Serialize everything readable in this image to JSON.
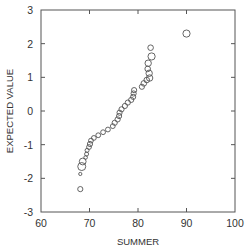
{
  "chart_data": {
    "type": "scatter",
    "title": "",
    "xlabel": "SUMMER",
    "ylabel": "EXPECTED VALUE",
    "xlim": [
      60,
      100
    ],
    "ylim": [
      -3,
      3
    ],
    "xticks": [
      60,
      70,
      80,
      90,
      100
    ],
    "yticks": [
      -3,
      -2,
      -1,
      0,
      1,
      2,
      3
    ],
    "xtick_labels": [
      "60",
      "70",
      "80",
      "90",
      "100"
    ],
    "ytick_labels": [
      "-3",
      "-2",
      "-1",
      "0",
      "1",
      "2",
      "3"
    ],
    "grid": false,
    "legend": null,
    "marker": "open-circle",
    "marker_color": "#555555",
    "series": [
      {
        "name": "SUMMER",
        "points": [
          {
            "x": 90.0,
            "y": 2.3,
            "size": 3.6
          },
          {
            "x": 82.6,
            "y": 1.88,
            "size": 2.8
          },
          {
            "x": 82.8,
            "y": 1.62,
            "size": 3.6
          },
          {
            "x": 82.1,
            "y": 1.42,
            "size": 3.2
          },
          {
            "x": 82.0,
            "y": 1.25,
            "size": 2.8
          },
          {
            "x": 82.3,
            "y": 1.12,
            "size": 3.2
          },
          {
            "x": 82.4,
            "y": 0.98,
            "size": 3.2
          },
          {
            "x": 81.8,
            "y": 0.92,
            "size": 2.8
          },
          {
            "x": 81.2,
            "y": 0.82,
            "size": 2.8
          },
          {
            "x": 80.8,
            "y": 0.72,
            "size": 2.6
          },
          {
            "x": 79.2,
            "y": 0.62,
            "size": 2.6
          },
          {
            "x": 79.1,
            "y": 0.52,
            "size": 2.6
          },
          {
            "x": 79.0,
            "y": 0.42,
            "size": 2.6
          },
          {
            "x": 78.6,
            "y": 0.33,
            "size": 2.6
          },
          {
            "x": 77.9,
            "y": 0.25,
            "size": 2.6
          },
          {
            "x": 77.3,
            "y": 0.15,
            "size": 2.6
          },
          {
            "x": 76.6,
            "y": 0.05,
            "size": 2.6
          },
          {
            "x": 76.2,
            "y": -0.05,
            "size": 2.6
          },
          {
            "x": 76.1,
            "y": -0.15,
            "size": 2.6
          },
          {
            "x": 75.8,
            "y": -0.25,
            "size": 2.6
          },
          {
            "x": 75.2,
            "y": -0.35,
            "size": 2.6
          },
          {
            "x": 74.8,
            "y": -0.45,
            "size": 2.4
          },
          {
            "x": 73.8,
            "y": -0.55,
            "size": 2.4
          },
          {
            "x": 72.8,
            "y": -0.63,
            "size": 2.4
          },
          {
            "x": 71.8,
            "y": -0.72,
            "size": 2.4
          },
          {
            "x": 70.9,
            "y": -0.8,
            "size": 2.4
          },
          {
            "x": 70.3,
            "y": -0.88,
            "size": 2.4
          },
          {
            "x": 70.1,
            "y": -0.98,
            "size": 2.6
          },
          {
            "x": 69.9,
            "y": -1.07,
            "size": 2.4
          },
          {
            "x": 69.5,
            "y": -1.17,
            "size": 2.0
          },
          {
            "x": 69.4,
            "y": -1.28,
            "size": 2.0
          },
          {
            "x": 69.2,
            "y": -1.38,
            "size": 1.8
          },
          {
            "x": 68.6,
            "y": -1.5,
            "size": 3.4
          },
          {
            "x": 68.4,
            "y": -1.65,
            "size": 4.0
          },
          {
            "x": 68.1,
            "y": -1.87,
            "size": 1.6
          },
          {
            "x": 68.1,
            "y": -2.32,
            "size": 2.6
          }
        ]
      }
    ]
  },
  "layout": {
    "plot_left": 41,
    "plot_top": 10,
    "plot_right": 235,
    "plot_bottom": 212
  }
}
